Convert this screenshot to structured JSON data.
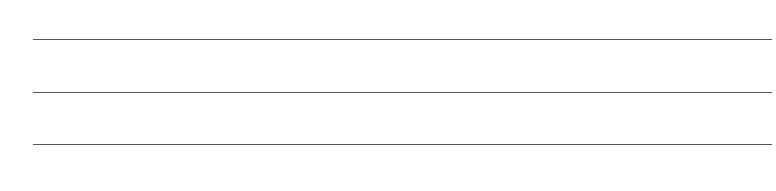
{
  "ruled_area": {
    "line_color": "#555555",
    "lines": [
      {
        "y": 39,
        "text": ""
      },
      {
        "y": 92,
        "text": ""
      },
      {
        "y": 144,
        "text": ""
      }
    ]
  }
}
